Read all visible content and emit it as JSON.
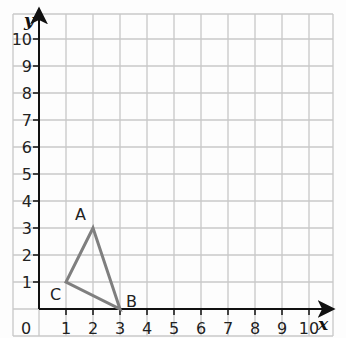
{
  "diagram": {
    "type": "coordinate-grid",
    "x_axis": {
      "label": "x",
      "ticks": [
        "1",
        "2",
        "3",
        "4",
        "5",
        "6",
        "7",
        "8",
        "9",
        "10"
      ],
      "min": 0,
      "max": 10
    },
    "y_axis": {
      "label": "y",
      "ticks": [
        "1",
        "2",
        "3",
        "4",
        "5",
        "6",
        "7",
        "8",
        "9",
        "10"
      ],
      "min": 0,
      "max": 10
    },
    "origin_label": "0",
    "triangle": {
      "stroke_color": "#7f7f7f",
      "points": [
        {
          "name": "A",
          "x": 2,
          "y": 3
        },
        {
          "name": "B",
          "x": 3,
          "y": 0
        },
        {
          "name": "C",
          "x": 1,
          "y": 1
        }
      ]
    },
    "colors": {
      "grid": "#c8c8c8",
      "axis": "#111111"
    }
  }
}
